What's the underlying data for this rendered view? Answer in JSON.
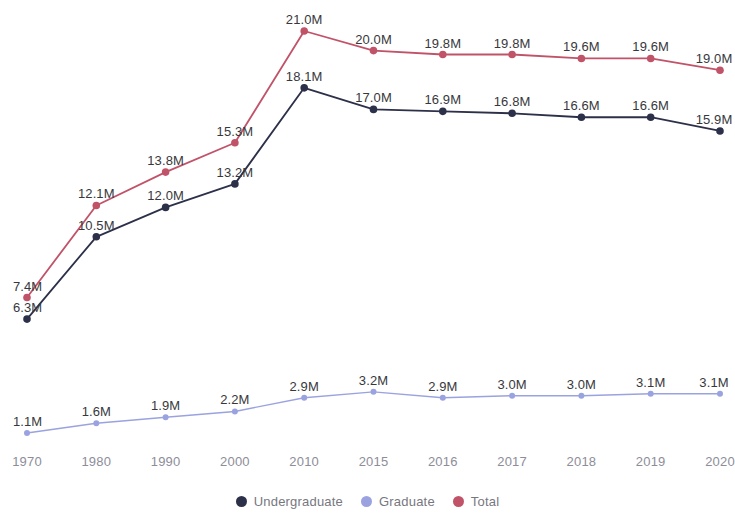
{
  "chart_data": {
    "type": "line",
    "title": "",
    "subtitle": "",
    "xlabel": "",
    "ylabel": "",
    "grid": false,
    "legend_position": "bottom-center",
    "x": [
      "1970",
      "1980",
      "1990",
      "2000",
      "2010",
      "2015",
      "2016",
      "2017",
      "2018",
      "2019",
      "2020"
    ],
    "categories": [
      "1970",
      "1980",
      "1990",
      "2000",
      "2010",
      "2015",
      "2016",
      "2017",
      "2018",
      "2019",
      "2020"
    ],
    "units": "M",
    "value_suffix": "M",
    "series": [
      {
        "name": "Undergraduate",
        "color": "#2c3049",
        "values": [
          6.3,
          10.5,
          12.0,
          13.2,
          18.1,
          17.0,
          16.9,
          16.8,
          16.6,
          16.6,
          15.9
        ],
        "labels": [
          "6.3M",
          "10.5M",
          "12.0M",
          "13.2M",
          "18.1M",
          "17.0M",
          "16.9M",
          "16.8M",
          "16.6M",
          "16.6M",
          "15.9M"
        ]
      },
      {
        "name": "Graduate",
        "color": "#9aa3e0",
        "values": [
          1.1,
          1.6,
          1.9,
          2.2,
          2.9,
          3.2,
          2.9,
          3.0,
          3.0,
          3.1,
          3.1
        ],
        "labels": [
          "1.1M",
          "1.6M",
          "1.9M",
          "2.2M",
          "2.9M",
          "3.2M",
          "2.9M",
          "3.0M",
          "3.0M",
          "3.1M",
          "3.1M"
        ]
      },
      {
        "name": "Total",
        "color": "#c15369",
        "values": [
          7.4,
          12.1,
          13.8,
          15.3,
          21.0,
          20.0,
          19.8,
          19.8,
          19.6,
          19.6,
          19.0
        ],
        "labels": [
          "7.4M",
          "12.1M",
          "13.8M",
          "15.3M",
          "21.0M",
          "20.0M",
          "19.8M",
          "19.8M",
          "19.6M",
          "19.6M",
          "19.0M"
        ]
      }
    ],
    "axis_tick_labels": [
      "1970",
      "1980",
      "1990",
      "2000",
      "2010",
      "2015",
      "2016",
      "2017",
      "2018",
      "2019",
      "2020"
    ],
    "legend": [
      {
        "label": "Undergraduate",
        "color": "#2c3049"
      },
      {
        "label": "Graduate",
        "color": "#9aa3e0"
      },
      {
        "label": "Total",
        "color": "#c15369"
      }
    ]
  },
  "colors": {
    "background": "#ffffff",
    "undergraduate": "#2c3049",
    "graduate": "#9aa3e0",
    "total": "#c15369",
    "data_label_text": "#38383c",
    "axis_label_text": "#8d8d99",
    "legend_label_text": "#77777f"
  }
}
